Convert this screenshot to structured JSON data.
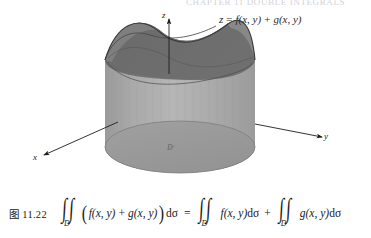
{
  "page": {
    "top_remnant_text": "CHAPTER 11 DOUBLE INTEGRALS",
    "background_color": "#ffffff"
  },
  "figure": {
    "name": "saddle-surface-over-elliptic-cylinder",
    "surface_equation": {
      "lhs": "z",
      "equals": "=",
      "term1": "f(x, y)",
      "plus": "+",
      "term2": "g(x, y)",
      "full": "z = f(x, y) + g(x, y)"
    },
    "axes": {
      "z_label": "z",
      "y_label": "y",
      "x_label": "x"
    },
    "domain_label": "D",
    "colors": {
      "surface_dark": "#6f6f6f",
      "surface_mid": "#8a8a8a",
      "cylinder_side": "#a5a5a5",
      "cylinder_side_light": "#b4b4b4",
      "base_ellipse": "#9b9b9b",
      "outline": "#3c3c3c",
      "axis": "#1d1d1d"
    }
  },
  "caption": {
    "figure_number": "图 11.22",
    "formula": {
      "integral_symbol": "∫",
      "domain_subscript": "D",
      "lhs_open_paren": "(",
      "lhs_term1": "f(x, y)",
      "lhs_plus": "+",
      "lhs_term2": "g(x, y)",
      "lhs_close_paren": ")",
      "lhs_measure": "dσ",
      "equals": "=",
      "rhs_term1": "f(x, y)",
      "rhs_measure1": "dσ",
      "rhs_plus": "+",
      "rhs_term2": "g(x, y)",
      "rhs_measure2": "dσ",
      "full_text": "∬_D (f(x,y) + g(x,y))dσ = ∬_D f(x,y)dσ + ∬_D g(x,y)dσ"
    }
  }
}
